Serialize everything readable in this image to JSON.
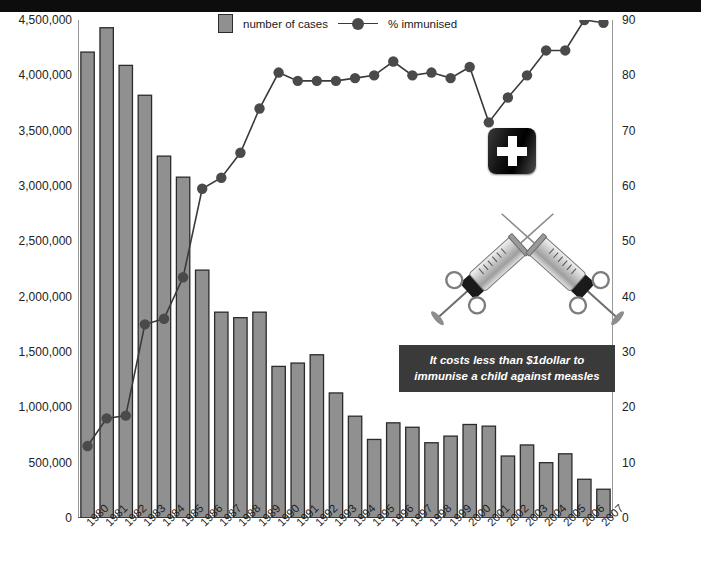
{
  "legend": {
    "bar_label": "number of cases",
    "line_label": "% immunised"
  },
  "callout": {
    "text": "It costs less than $1dollar to immunise a child against measles"
  },
  "illustration": {
    "badge_name": "medical-cross-badge",
    "syringes_name": "crossed-syringes"
  },
  "colors": {
    "bar_fill": "#909090",
    "bar_stroke": "#2b2b2b",
    "line": "#3a3a3a",
    "marker": "#4a4a4a",
    "callout_bg": "#3a3a3a",
    "top_band": "#0d0d0d"
  },
  "chart_data": {
    "type": "bar",
    "title": "",
    "xlabel": "",
    "ylabel": "",
    "y2label": "immunisation coverage %",
    "grid": false,
    "legend_position": "top-center",
    "ylim": [
      0,
      4500000
    ],
    "y2lim": [
      0,
      90
    ],
    "yticks": [
      0,
      500000,
      1000000,
      1500000,
      2000000,
      2500000,
      3000000,
      3500000,
      4000000,
      4500000
    ],
    "ytick_labels": [
      "0",
      "500,000",
      "1,000,000",
      "1,500,000",
      "2,000,000",
      "2,500,000",
      "3,000,000",
      "3,500,000",
      "4,000,000",
      "4,500,000"
    ],
    "y2ticks": [
      0,
      10,
      20,
      30,
      40,
      50,
      60,
      70,
      80,
      90
    ],
    "y2tick_labels": [
      "0",
      "10",
      "20",
      "30",
      "40",
      "50",
      "60",
      "70",
      "80",
      "90"
    ],
    "categories": [
      "1980",
      "1981",
      "1982",
      "1983",
      "1984",
      "1985",
      "1986",
      "1987",
      "1988",
      "1989",
      "1990",
      "1991",
      "1992",
      "1993",
      "1994",
      "1995",
      "1996",
      "1997",
      "1998",
      "1999",
      "2000",
      "2001",
      "2002",
      "2003",
      "2004",
      "2005",
      "2006",
      "2007"
    ],
    "series": [
      {
        "name": "number of cases",
        "axis": "left",
        "kind": "bar",
        "values": [
          4210000,
          4430000,
          4090000,
          3820000,
          3270000,
          3080000,
          2240000,
          1860000,
          1810000,
          1860000,
          1370000,
          1400000,
          1475000,
          1130000,
          920000,
          710000,
          860000,
          820000,
          680000,
          740000,
          845000,
          830000,
          560000,
          660000,
          500000,
          580000,
          350000,
          260000
        ]
      },
      {
        "name": "% immunised",
        "axis": "right",
        "kind": "line",
        "values": [
          13,
          18,
          18.5,
          35,
          36,
          43.5,
          59.5,
          61.5,
          66,
          74,
          80.5,
          79,
          79,
          79,
          79.5,
          80,
          82.5,
          80,
          80.5,
          79.5,
          81.5,
          71.5,
          76,
          80,
          84.5,
          84.5,
          90,
          89.5
        ]
      }
    ]
  }
}
